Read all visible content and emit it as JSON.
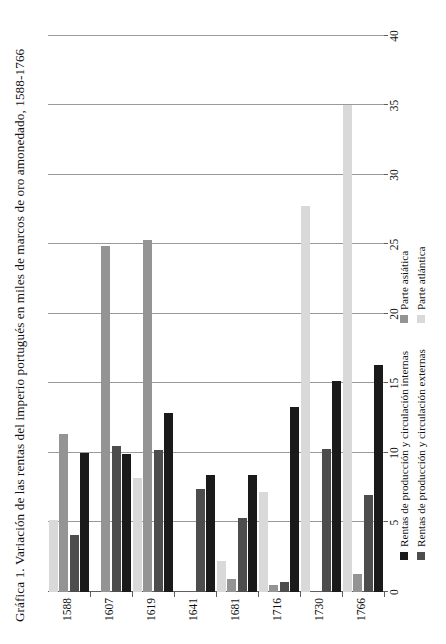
{
  "figure": {
    "title": "Gráfica 1. Variación de las rentas del imperio portugués en miles de marcos de oro amonedado, 1588-1766"
  },
  "legend": {
    "items": [
      {
        "label": "Rentas de producción y circulación internas",
        "color": "#1a1a1a"
      },
      {
        "label": "Rentas de producción y circulación externas",
        "color": "#4d4d4d"
      },
      {
        "label": "Parte asiática",
        "color": "#949494"
      },
      {
        "label": "Parte atlántica",
        "color": "#d9d9d9"
      }
    ]
  },
  "chart_data": {
    "type": "bar",
    "orientation": "horizontal",
    "title": "Gráfica 1. Variación de las rentas del imperio portugués en miles de marcos de oro amonedado, 1588-1766",
    "xlabel": "",
    "ylabel": "",
    "xlim": [
      0,
      40
    ],
    "xticks": [
      0,
      5,
      10,
      15,
      20,
      25,
      30,
      35,
      40
    ],
    "xtick_labels": [
      "0",
      "5",
      "10",
      "15",
      "20",
      "25",
      "30",
      "35",
      "40"
    ],
    "grid": true,
    "grid_axis": "x",
    "legend_position": "bottom",
    "categories": [
      "1588",
      "1607",
      "1619",
      "1641",
      "1681",
      "1716",
      "1730",
      "1766"
    ],
    "series": [
      {
        "name": "Rentas de producción y circulación internas",
        "color": "#1a1a1a",
        "values": [
          10.0,
          9.9,
          12.9,
          8.4,
          8.4,
          13.3,
          15.2,
          16.3
        ]
      },
      {
        "name": "Rentas de producción y circulación externas",
        "color": "#4d4d4d",
        "values": [
          4.1,
          10.5,
          10.2,
          7.4,
          5.3,
          0.7,
          10.3,
          7.0
        ]
      },
      {
        "name": "Parte asiática",
        "color": "#949494",
        "values": [
          11.4,
          24.9,
          25.3,
          0.0,
          0.9,
          0.5,
          0.0,
          1.3
        ]
      },
      {
        "name": "Parte atlántica",
        "color": "#d9d9d9",
        "values": [
          5.2,
          0.0,
          8.2,
          0.0,
          2.2,
          7.2,
          27.8,
          35.0
        ]
      }
    ]
  }
}
